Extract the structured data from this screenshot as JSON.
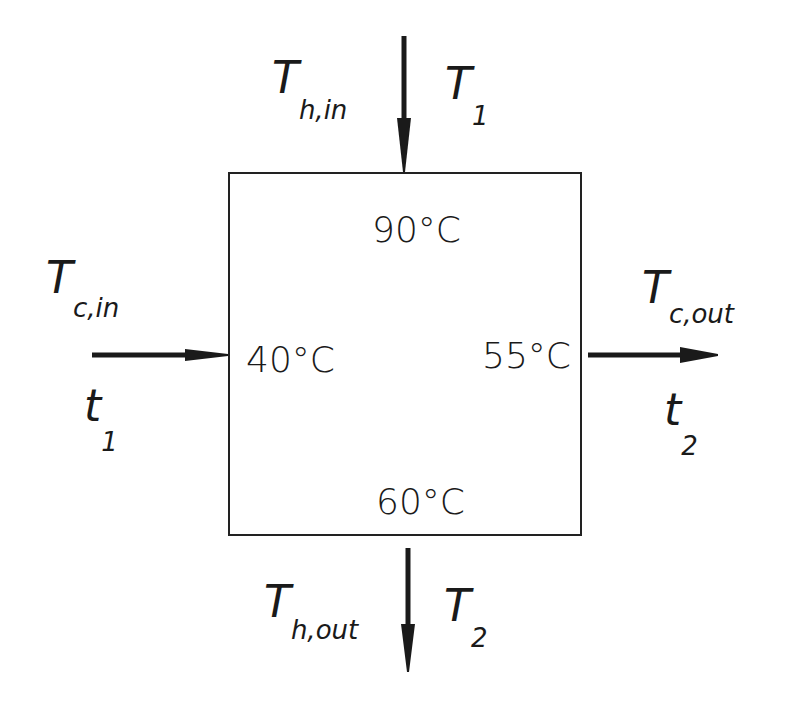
{
  "diagram": {
    "type": "heat-exchanger-temperature-schematic",
    "box": {
      "temperatures": {
        "top": "90°C",
        "left": "40°C",
        "right": "55°C",
        "bottom": "60°C"
      }
    },
    "streams": {
      "hot_in": {
        "symbol_main": "T",
        "symbol_sub": "h,in",
        "alt_main": "T",
        "alt_sub": "1",
        "direction": "down",
        "position": "top"
      },
      "hot_out": {
        "symbol_main": "T",
        "symbol_sub": "h,out",
        "alt_main": "T",
        "alt_sub": "2",
        "direction": "down",
        "position": "bottom"
      },
      "cold_in": {
        "symbol_main": "T",
        "symbol_sub": "c,in",
        "alt_main": "t",
        "alt_sub": "1",
        "direction": "right",
        "position": "left"
      },
      "cold_out": {
        "symbol_main": "T",
        "symbol_sub": "c,out",
        "alt_main": "t",
        "alt_sub": "2",
        "direction": "right",
        "position": "right"
      }
    },
    "colors": {
      "ink": "#1a1a1a",
      "background": "#ffffff"
    }
  }
}
